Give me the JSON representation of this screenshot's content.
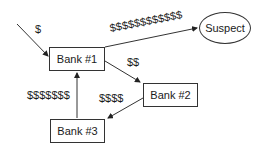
{
  "diagram": {
    "nodes": [
      {
        "id": "bank1",
        "label": "Bank #1"
      },
      {
        "id": "bank2",
        "label": "Bank #2"
      },
      {
        "id": "bank3",
        "label": "Bank #3"
      },
      {
        "id": "suspect",
        "label": "Suspect"
      }
    ],
    "edges": [
      {
        "from": "external",
        "to": "bank1",
        "label": "$"
      },
      {
        "from": "bank1",
        "to": "suspect",
        "label": "$$$$$$$$$$$$"
      },
      {
        "from": "bank1",
        "to": "bank2",
        "label": "$$"
      },
      {
        "from": "bank2",
        "to": "bank3",
        "label": "$$$$"
      },
      {
        "from": "bank3",
        "to": "bank1",
        "label": "$$$$$$$"
      }
    ]
  }
}
